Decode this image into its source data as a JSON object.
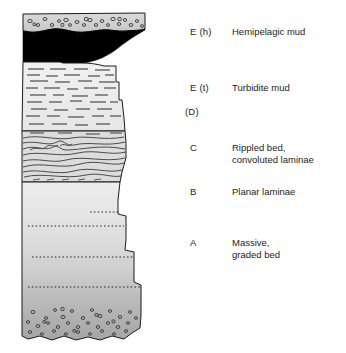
{
  "figure": {
    "columns": {
      "left_edge_x": 22,
      "top_y": 13,
      "bottom_y": 340
    },
    "palette": {
      "hemipelagic_top_fill": "#d2d2d2",
      "black_bed_fill": "#000000",
      "mud_light_fill": "#ededed",
      "graded_top_fill": "#e3e3e3",
      "graded_bottom_fill": "#a6a6a6",
      "outline": "#1a1a1a",
      "lamina_line": "#3a3a3a",
      "clast_outline": "#2b2b2b",
      "text": "#232323",
      "background": "#ffffff"
    },
    "divisions": [
      {
        "code": "E  (h)",
        "description_lines": [
          "Hemipelagic mud"
        ],
        "code_x": 190,
        "code_y": 32,
        "desc_x": 232,
        "desc_y": 32,
        "texture": "pebbly-clast-mud",
        "band_top": 13,
        "band_bottom": 33
      },
      {
        "code": "E  (t)",
        "description_lines": [
          "Turbidite mud"
        ],
        "code_x": 190,
        "code_y": 88,
        "desc_x": 232,
        "desc_y": 88,
        "texture": "discontinuous-horizontal-dashes",
        "band_top": 63,
        "band_bottom": 130
      },
      {
        "code": "(D)",
        "description_lines": [],
        "code_x": 185,
        "code_y": 112,
        "desc_x": 232,
        "desc_y": 112,
        "texture": "none",
        "band_top": 125,
        "band_bottom": 132
      },
      {
        "code": "C",
        "description_lines": [
          "Rippled bed,",
          "convoluted laminae"
        ],
        "code_x": 190,
        "code_y": 148,
        "desc_x": 232,
        "desc_y": 143,
        "texture": "convoluted-wavy-laminae",
        "band_top": 130,
        "band_bottom": 182
      },
      {
        "code": "B",
        "description_lines": [
          "Planar laminae"
        ],
        "code_x": 190,
        "code_y": 192,
        "desc_x": 232,
        "desc_y": 192,
        "texture": "planar-laminae",
        "band_top": 182,
        "band_bottom": 215
      },
      {
        "code": "A",
        "description_lines": [
          "Massive,",
          "graded bed"
        ],
        "code_x": 190,
        "code_y": 243,
        "desc_x": 232,
        "desc_y": 238,
        "texture": "massive-graded-with-dotted-partings",
        "band_top": 215,
        "band_bottom": 340
      }
    ],
    "black_bed": {
      "top_y": 31,
      "bottom_y": 63,
      "left_x": 22,
      "right_x_top": 145,
      "right_x_bottom": 70
    },
    "dotted_partings_y": [
      212,
      226,
      257,
      287
    ],
    "step_edges": [
      {
        "y": 63,
        "x": 116
      },
      {
        "y": 100,
        "x": 119
      },
      {
        "y": 130,
        "x": 125
      },
      {
        "y": 182,
        "x": 118
      },
      {
        "y": 222,
        "x": 126
      },
      {
        "y": 255,
        "x": 134
      },
      {
        "y": 288,
        "x": 141
      }
    ]
  }
}
